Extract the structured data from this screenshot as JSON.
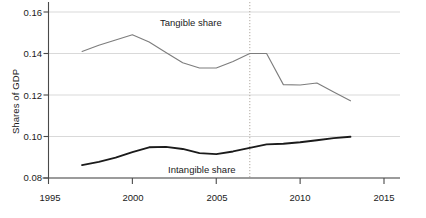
{
  "chart_data": {
    "type": "line",
    "title": "",
    "xlabel": "",
    "ylabel": "Shares of GDP",
    "xlim": [
      1995,
      2015
    ],
    "ylim": [
      0.08,
      0.16
    ],
    "xticks": [
      "1995",
      "2000",
      "2005",
      "2010",
      "2015"
    ],
    "yticks": [
      "0.08",
      "0.10",
      "0.12",
      "0.14",
      "0.16"
    ],
    "grid": "horizontal",
    "legend_position": "inline-annotations",
    "annotations": [
      {
        "text": "Tangible share",
        "x": 2002.2,
        "y": 0.1555
      },
      {
        "text": "Intangible share",
        "x": 2003.1,
        "y": 0.0862
      }
    ],
    "reference_lines": [
      {
        "orientation": "vertical",
        "x": 2007,
        "style": "dotted",
        "color": "#b0a8a0"
      }
    ],
    "x": [
      1997,
      1998,
      1999,
      2000,
      2001,
      2002,
      2003,
      2004,
      2005,
      2006,
      2007,
      2008,
      2009,
      2010,
      2011,
      2012,
      2013
    ],
    "series": [
      {
        "name": "Tangible share",
        "color": "#7d7d7d",
        "width": 1.1,
        "values": [
          0.141,
          0.144,
          0.1465,
          0.149,
          0.1455,
          0.1405,
          0.1355,
          0.133,
          0.133,
          0.1362,
          0.14,
          0.14,
          0.125,
          0.1248,
          0.1258,
          0.1215,
          0.1172
        ]
      },
      {
        "name": "Intangible share",
        "color": "#1b1b1b",
        "width": 1.9,
        "values": [
          0.0862,
          0.0878,
          0.0898,
          0.0925,
          0.0948,
          0.095,
          0.094,
          0.092,
          0.0915,
          0.0928,
          0.0945,
          0.0962,
          0.0965,
          0.0972,
          0.0982,
          0.0992,
          0.0999
        ]
      }
    ]
  },
  "colors": {
    "gridline": "#d9d9d9",
    "axis": "#4a4a4a",
    "tangible": "#7d7d7d",
    "intangible": "#1b1b1b",
    "reference": "#b0a8a0",
    "background": "#ffffff"
  }
}
